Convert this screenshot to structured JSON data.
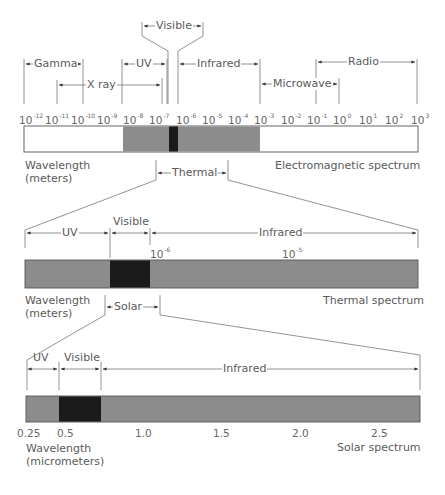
{
  "figure": {
    "em_spectrum": {
      "title": "Electromagnetic spectrum",
      "axis_label_line1": "Wavelength",
      "axis_label_line2": "(meters)",
      "tick_base": "10",
      "tick_exponents": [
        "-12",
        "-11",
        "-10",
        "-9",
        "-8",
        "-7",
        "-6",
        "-5",
        "-4",
        "-3",
        "-2",
        "-1",
        "0",
        "1",
        "2",
        "3"
      ],
      "bands": {
        "gamma": "Gamma",
        "xray": "X ray",
        "uv": "UV",
        "visible": "Visible",
        "infrared": "Infrared",
        "microwave": "Microwave",
        "radio": "Radio"
      },
      "zoom_bracket": "Thermal"
    },
    "thermal_spectrum": {
      "title": "Thermal spectrum",
      "axis_label_line1": "Wavelength",
      "axis_label_line2": "(meters)",
      "tick_base": "10",
      "tick_exponents": [
        "-6",
        "-5"
      ],
      "bands": {
        "uv": "UV",
        "visible": "Visible",
        "infrared": "Infrared"
      },
      "zoom_bracket": "Solar"
    },
    "solar_spectrum": {
      "title": "Solar spectrum",
      "axis_label_line1": "Wavelength",
      "axis_label_line2": "(micrometers)",
      "ticks": [
        "0.25",
        "0.5",
        "1.0",
        "1.5",
        "2.0",
        "2.5"
      ],
      "bands": {
        "uv": "UV",
        "visible": "Visible",
        "infrared": "Infrared"
      }
    },
    "colors": {
      "band_gray": "#8c8c8c",
      "visible_black": "#1a1a1a",
      "outside_white": "#ffffff",
      "line": "#777777"
    }
  }
}
